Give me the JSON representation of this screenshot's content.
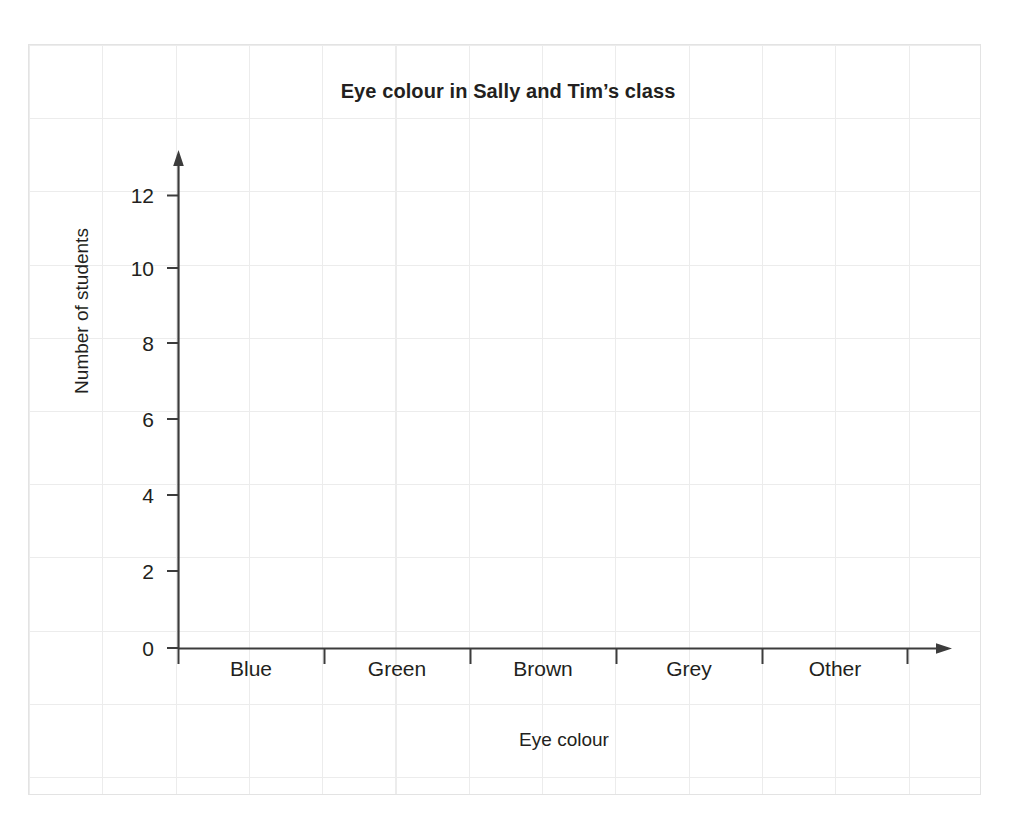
{
  "chart_data": {
    "type": "bar",
    "title": "Eye colour in Sally and Tim’s class",
    "xlabel": "Eye colour",
    "ylabel": "Number of students",
    "categories": [
      "Blue",
      "Green",
      "Brown",
      "Grey",
      "Other"
    ],
    "values": [
      null,
      null,
      null,
      null,
      null
    ],
    "series": [
      {
        "name": "Number of students",
        "values": [
          null,
          null,
          null,
          null,
          null
        ]
      }
    ],
    "ylim": [
      0,
      13
    ],
    "yticks": [
      0,
      2,
      4,
      6,
      8,
      10,
      12
    ],
    "ytick_labels": [
      "0",
      "2",
      "4",
      "6",
      "8",
      "10",
      "12"
    ],
    "xtick_labels": [
      "Blue",
      "Green",
      "Brown",
      "Grey",
      "Other"
    ],
    "grid": true,
    "grid_style": "light-grey squared worksheet paper",
    "legend": false,
    "legend_position": "none",
    "annotations": [],
    "note": "Blank axes — no bars plotted; worksheet template for students to draw the bar chart."
  },
  "figure": {
    "title": "Eye colour in Sally and Tim’s class",
    "axis_titles": {
      "x": "Eye colour",
      "y": "Number of students"
    },
    "y_ticks": [
      "12",
      "10",
      "8",
      "6",
      "4",
      "2",
      "0"
    ],
    "x_categories": [
      "Blue",
      "Green",
      "Brown",
      "Grey",
      "Other"
    ]
  },
  "colors": {
    "ink": "#231f20",
    "axis": "#3c3c3c",
    "grid": "#ececec",
    "panel_border": "#e3e3e3",
    "background": "#ffffff"
  },
  "icons": {
    "y_axis_arrow": "arrow-up-icon",
    "x_axis_arrow": "arrow-right-icon"
  }
}
